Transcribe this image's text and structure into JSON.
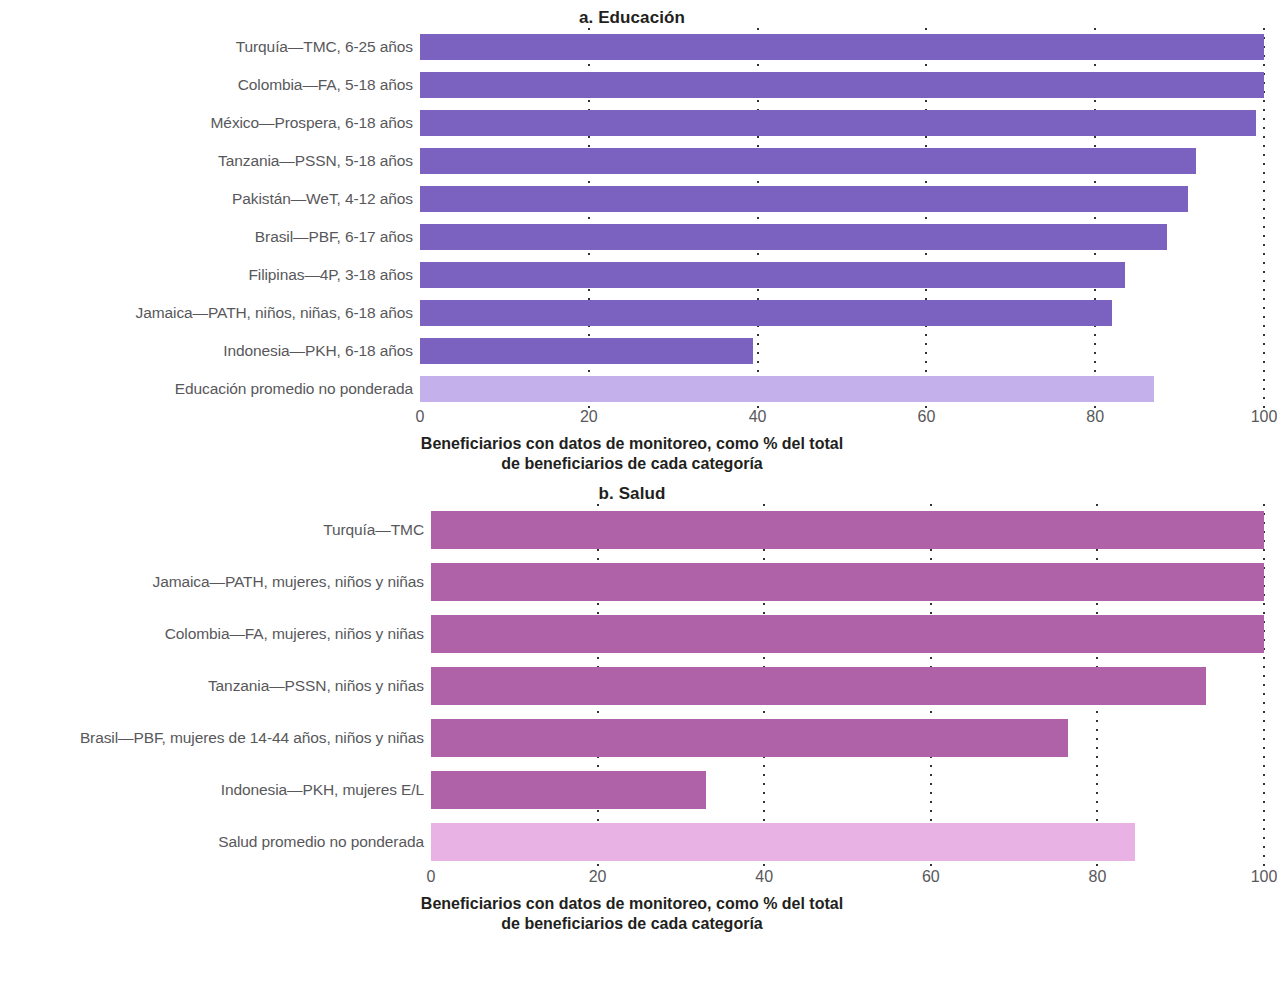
{
  "chart_data": [
    {
      "type": "bar",
      "orientation": "horizontal",
      "title": "a. Educación",
      "panel_letter": "a.",
      "panel_name": "Educación",
      "xlabel": "Beneficiarios con datos de monitoreo, como % del total de beneficiarios de cada categoría",
      "xlabel_line1": "Beneficiarios con datos de monitoreo, como % del total",
      "xlabel_line2": "de beneficiarios de cada categoría",
      "ylabel": "",
      "xlim": [
        0,
        100
      ],
      "ticks": [
        "0",
        "20",
        "40",
        "60",
        "80",
        "100"
      ],
      "tick_values": [
        0,
        20,
        40,
        60,
        80,
        100
      ],
      "grid": true,
      "grid_style": "dotted-vertical",
      "legend": "none",
      "bar_color": "#7b62c0",
      "average_bar_color": "#c4b0ea",
      "categories": [
        "Turquía—TMC, 6-25 años",
        "Colombia—FA, 5-18 años",
        "México—Prospera, 6-18 años",
        "Tanzania—PSSN, 5-18 años",
        "Pakistán—WeT, 4-12 años",
        "Brasil—PBF, 6-17 años",
        "Filipinas—4P, 3-18 años",
        "Jamaica—PATH, niños, niñas, 6-18 años",
        "Indonesia—PKH, 6-18 años",
        "Educación promedio no ponderada"
      ],
      "values": [
        100,
        100,
        99,
        92,
        91,
        88.5,
        83.5,
        82,
        39.5,
        87
      ],
      "average_index": 9
    },
    {
      "type": "bar",
      "orientation": "horizontal",
      "title": "b. Salud",
      "panel_letter": "b.",
      "panel_name": "Salud",
      "xlabel": "Beneficiarios con datos de monitoreo, como % del total de beneficiarios de cada categoría",
      "xlabel_line1": "Beneficiarios con datos de monitoreo, como % del total",
      "xlabel_line2": "de beneficiarios de cada categoría",
      "ylabel": "",
      "xlim": [
        0,
        100
      ],
      "ticks": [
        "0",
        "20",
        "40",
        "60",
        "80",
        "100"
      ],
      "tick_values": [
        0,
        20,
        40,
        60,
        80,
        100
      ],
      "grid": true,
      "grid_style": "dotted-vertical",
      "legend": "none",
      "bar_color": "#b062a8",
      "average_bar_color": "#e9b2e4",
      "categories": [
        "Turquía—TMC",
        "Jamaica—PATH, mujeres, niños y niñas",
        "Colombia—FA, mujeres, niños y niñas",
        "Tanzania—PSSN, niños y niñas",
        "Brasil—PBF, mujeres de 14-44 años, niños y niñas",
        "Indonesia—PKH, mujeres E/L",
        "Salud promedio no ponderada"
      ],
      "values": [
        100,
        100,
        100,
        93,
        76.5,
        33,
        84.5
      ],
      "average_index": 6
    }
  ]
}
